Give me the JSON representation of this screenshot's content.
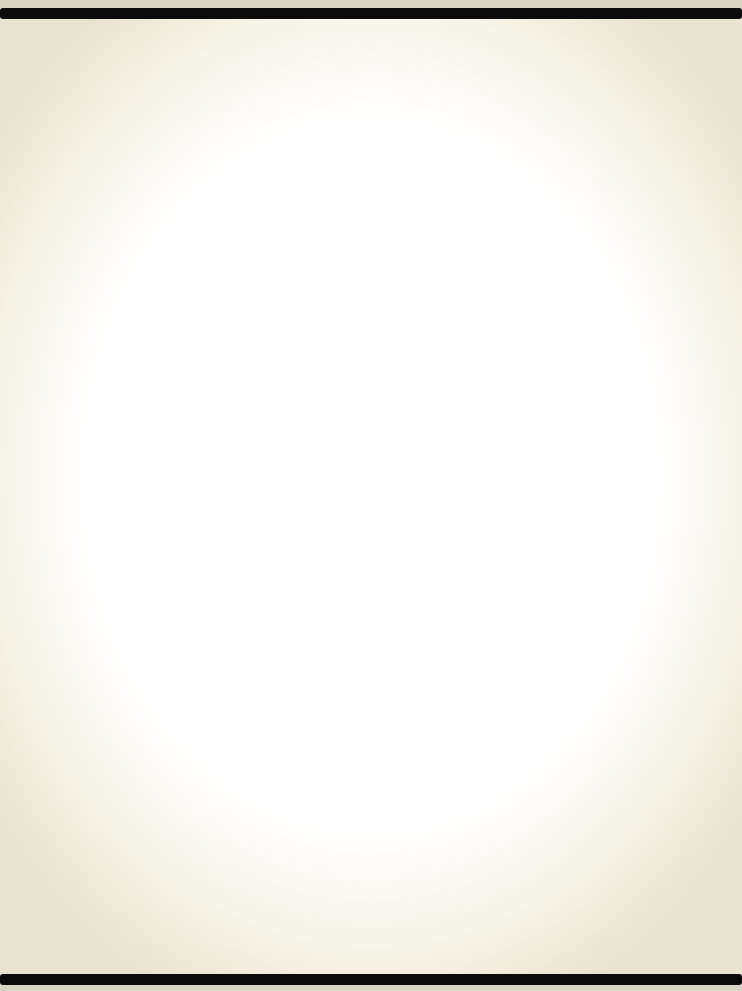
{
  "document": {
    "type": "scanned-page",
    "content": "",
    "background_color": "#ffffff",
    "edge_tint": "#e9e4d2",
    "bar_color": "#0b0b0b"
  }
}
